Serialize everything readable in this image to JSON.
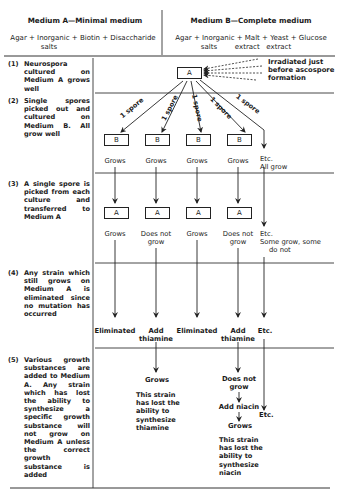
{
  "header": {
    "medium_a": {
      "title": "Medium A—Minimal medium",
      "formula_line1": "Agar + Inorganic + Biotin + Disaccharide",
      "formula_line2": "salts"
    },
    "medium_b": {
      "title": "Medium B—Complete medium",
      "formula_line1": "Agar + Inorganic + Malt + Yeast + Glucose",
      "formula_line2": "salts        extract   extract"
    }
  },
  "steps": [
    {
      "num": "(1)",
      "text": "Neurospora cultured on Medium A grows well"
    },
    {
      "num": "(2)",
      "text": "Single spores picked out and cultured on Medium B. All grow well"
    },
    {
      "num": "(3)",
      "text": "A single spore is picked from each culture and transferred to Medium A"
    },
    {
      "num": "(4)",
      "text": "Any strain which still grows on Medium A is eliminated since no mutation has occurred"
    },
    {
      "num": "(5)",
      "text": "Various growth substances are added to Medium A. Any strain which has lost the ability to synthesize a specific growth substance will not grow on Medium A unless the correct growth substance is added"
    }
  ],
  "diagram": {
    "top_box": "A",
    "irradiated_note_line1": "Irradiated just",
    "irradiated_note_line2": "before ascospore",
    "irradiated_note_line3": "formation",
    "spore_label": "1 spore",
    "row2_boxes": [
      "B",
      "B",
      "B",
      "B"
    ],
    "row2_results": [
      "Grows",
      "Grows",
      "Grows",
      "Grows"
    ],
    "row2_etc_line1": "Etc.",
    "row2_etc_line2": "All grow",
    "row3_boxes": [
      "A",
      "A",
      "A",
      "A"
    ],
    "row3_results": [
      {
        "line1": "Grows",
        "line2": ""
      },
      {
        "line1": "Does not",
        "line2": "grow"
      },
      {
        "line1": "Grows",
        "line2": ""
      },
      {
        "line1": "Does not",
        "line2": "grow"
      }
    ],
    "row3_etc_line1": "Etc.",
    "row3_etc_line2": "Some grow, some",
    "row3_etc_line3": "do not",
    "row4_results": [
      {
        "line1": "Eliminated",
        "line2": ""
      },
      {
        "line1": "Add",
        "line2": "thiamine"
      },
      {
        "line1": "Eliminated",
        "line2": ""
      },
      {
        "line1": "Add",
        "line2": "thiamine"
      }
    ],
    "row4_etc": "Etc.",
    "row5_col2_result": "Grows",
    "row5_col2_desc": [
      "This strain",
      "has lost the",
      "ability to",
      "synthesize",
      "thiamine"
    ],
    "row5_col4_result_line1": "Does not",
    "row5_col4_result_line2": "grow",
    "row5_col4_add": "Add niacin",
    "row5_col4_result2": "Grows",
    "row5_col4_desc": [
      "This strain",
      "has lost the",
      "ability to",
      "synthesize",
      "niacin"
    ],
    "row5_etc": "Etc."
  }
}
